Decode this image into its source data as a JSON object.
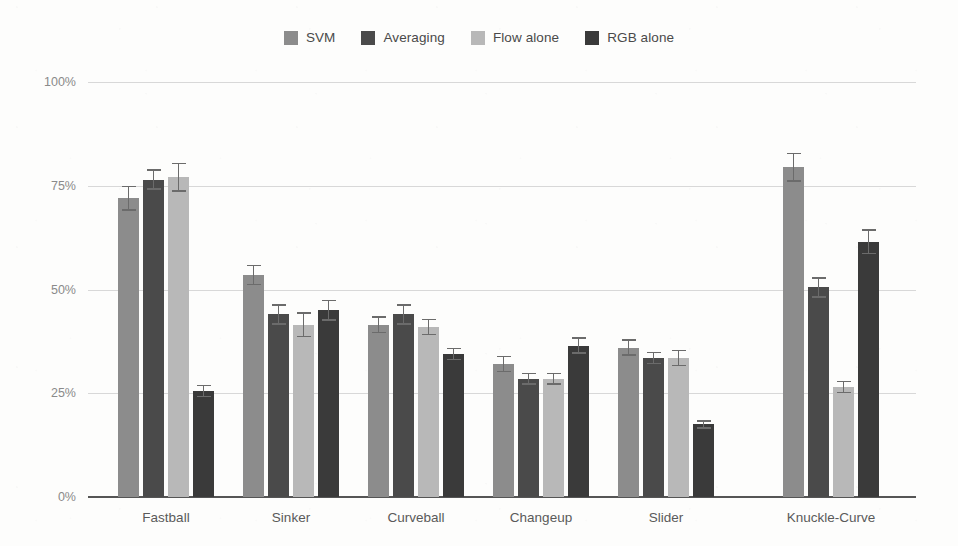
{
  "chart_data": {
    "type": "bar",
    "title": "",
    "xlabel": "",
    "ylabel": "",
    "ylim": [
      0,
      100
    ],
    "ytick_labels": [
      "0%",
      "25%",
      "50%",
      "75%",
      "100%"
    ],
    "ytick_values": [
      0,
      25,
      50,
      75,
      100
    ],
    "grid": true,
    "grid_axis": "y",
    "legend_position": "top-center",
    "orientation": "vertical",
    "error_bars": true,
    "categories": [
      "Fastball",
      "Sinker",
      "Curveball",
      "Changeup",
      "Slider",
      "Knuckle-Curve"
    ],
    "series": [
      {
        "name": "SVM",
        "color": "#8c8c8c",
        "values": [
          72,
          53.5,
          41.5,
          32,
          36,
          79.5
        ],
        "errors": [
          3,
          2.5,
          2,
          2,
          2,
          3.5
        ]
      },
      {
        "name": "Averaging",
        "color": "#4a4a4a",
        "values": [
          76.5,
          44,
          44,
          28.5,
          33.5,
          50.5
        ],
        "errors": [
          2.5,
          2.5,
          2.5,
          1.5,
          1.5,
          2.5
        ]
      },
      {
        "name": "Flow alone",
        "color": "#b8b8b8",
        "values": [
          77,
          41.5,
          41,
          28.5,
          33.5,
          26.5
        ],
        "errors": [
          3.5,
          3,
          2,
          1.5,
          2,
          1.5
        ]
      },
      {
        "name": "RGB alone",
        "color": "#3a3a3a",
        "values": [
          25.5,
          45,
          34.5,
          36.5,
          17.5,
          61.5
        ],
        "errors": [
          1.5,
          2.5,
          1.5,
          2,
          1,
          3
        ]
      }
    ]
  },
  "colors": {
    "background": "#fdfdfc",
    "gridline": "#d8d8d8",
    "axis": "#555555",
    "ytick_text": "#8a8a8a",
    "xtick_text": "#5a5a5a",
    "legend_text": "#4a4a4a",
    "error_bar": "#6b6b6b"
  }
}
